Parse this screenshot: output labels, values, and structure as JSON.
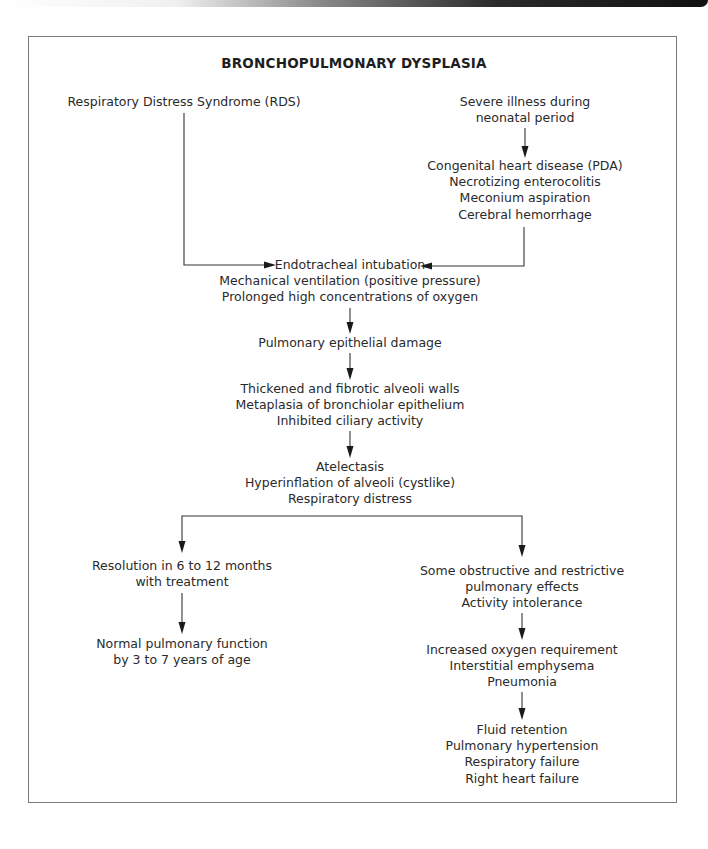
{
  "title": "BRONCHOPULMONARY DYSPLASIA",
  "nodes": {
    "rds": {
      "lines": [
        "Respiratory Distress Syndrome (RDS)"
      ]
    },
    "severe_illness": {
      "lines": [
        "Severe illness during",
        "neonatal period"
      ]
    },
    "conditions": {
      "lines": [
        "Congenital heart disease (PDA)",
        "Necrotizing enterocolitis",
        "Meconium aspiration",
        "Cerebral hemorrhage"
      ]
    },
    "interventions": {
      "lines": [
        "Endotracheal intubation",
        "Mechanical ventilation (positive pressure)",
        "Prolonged high concentrations of oxygen"
      ]
    },
    "epithelial_damage": {
      "lines": [
        "Pulmonary epithelial damage"
      ]
    },
    "alveoli_changes": {
      "lines": [
        "Thickened and fibrotic alveoli walls",
        "Metaplasia of bronchiolar epithelium",
        "Inhibited ciliary activity"
      ]
    },
    "atelectasis": {
      "lines": [
        "Atelectasis",
        "Hyperinflation of alveoli (cystlike)",
        "Respiratory distress"
      ]
    },
    "resolution": {
      "lines": [
        "Resolution in 6 to 12 months",
        "with treatment"
      ]
    },
    "normal_function": {
      "lines": [
        "Normal pulmonary function",
        "by 3 to 7 years of age"
      ]
    },
    "obstructive": {
      "lines": [
        "Some obstructive and restrictive",
        "pulmonary effects",
        "Activity intolerance"
      ]
    },
    "oxygen_requirement": {
      "lines": [
        "Increased oxygen requirement",
        "Interstitial emphysema",
        "Pneumonia"
      ]
    },
    "outcomes": {
      "lines": [
        "Fluid retention",
        "Pulmonary hypertension",
        "Respiratory failure",
        "Right heart failure"
      ]
    }
  },
  "edges": [
    {
      "from": "rds",
      "to": "interventions"
    },
    {
      "from": "severe_illness",
      "to": "conditions"
    },
    {
      "from": "conditions",
      "to": "interventions"
    },
    {
      "from": "interventions",
      "to": "epithelial_damage"
    },
    {
      "from": "epithelial_damage",
      "to": "alveoli_changes"
    },
    {
      "from": "alveoli_changes",
      "to": "atelectasis"
    },
    {
      "from": "atelectasis",
      "to": "resolution"
    },
    {
      "from": "atelectasis",
      "to": "obstructive"
    },
    {
      "from": "resolution",
      "to": "normal_function"
    },
    {
      "from": "obstructive",
      "to": "oxygen_requirement"
    },
    {
      "from": "oxygen_requirement",
      "to": "outcomes"
    }
  ]
}
